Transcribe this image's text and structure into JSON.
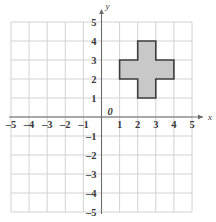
{
  "figure": {
    "kind": "coordinate-plane-with-polygon",
    "background_color": "#ffffff"
  },
  "grid": {
    "x_min": -5,
    "x_max": 5,
    "y_min": -5,
    "y_max": 5,
    "step": 1,
    "grid_color": "#d2d2d2",
    "axis_color": "#6b6b6b",
    "show_grid": true
  },
  "axes": {
    "x_axis_name": "x",
    "y_axis_name": "y",
    "origin_label": "0",
    "x_tick_labels": [
      "–5",
      "–4",
      "–3",
      "–2",
      "–1",
      "1",
      "2",
      "3",
      "4",
      "5"
    ],
    "x_tick_values": [
      -5,
      -4,
      -3,
      -2,
      -1,
      1,
      2,
      3,
      4,
      5
    ],
    "y_tick_labels": [
      "5",
      "4",
      "3",
      "2",
      "1",
      "–1",
      "–2",
      "–3",
      "–4",
      "–5"
    ],
    "y_tick_values": [
      5,
      4,
      3,
      2,
      1,
      -1,
      -2,
      -3,
      -4,
      -5
    ],
    "label_color": "#3a3a3a"
  },
  "shape": {
    "name": "plus-cross-polygon",
    "fill_color": "#c8c8c8",
    "stroke_color": "#3c3c3c",
    "stroke_width": 1.6,
    "vertices": [
      [
        2,
        4
      ],
      [
        3,
        4
      ],
      [
        3,
        3
      ],
      [
        4,
        3
      ],
      [
        4,
        2
      ],
      [
        3,
        2
      ],
      [
        3,
        1
      ],
      [
        2,
        1
      ],
      [
        2,
        2
      ],
      [
        1,
        2
      ],
      [
        1,
        3
      ],
      [
        2,
        3
      ]
    ],
    "horizontal_bar": {
      "x_range": [
        1,
        4
      ],
      "y_range": [
        2,
        3
      ]
    },
    "vertical_bar": {
      "x_range": [
        2,
        3
      ],
      "y_range": [
        1,
        4
      ]
    }
  }
}
